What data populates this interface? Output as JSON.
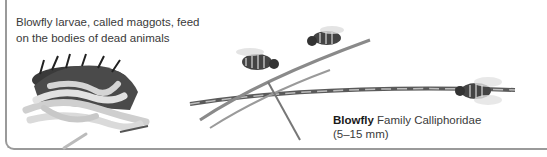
{
  "figure": {
    "larvae_caption": "Blowfly larvae, called maggots, feed on the bodies of dead animals",
    "species_name": "Blowfly",
    "species_family": "Family Calliphoridae",
    "species_size": "(5–15 mm)"
  }
}
